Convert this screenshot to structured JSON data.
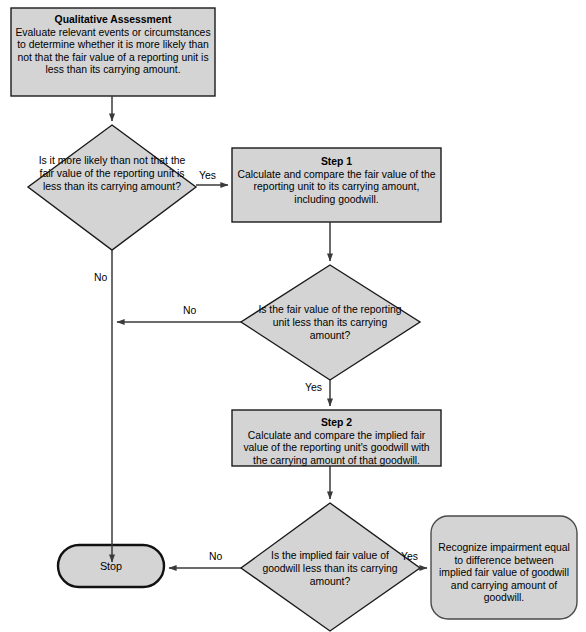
{
  "diagram": {
    "type": "flowchart",
    "background_color": "#ffffff",
    "shape_fill_color": "#d4d4d4",
    "shape_stroke_color": "#1a1a1a",
    "connector_color": "#3a3a3a",
    "text_color": "#000000"
  },
  "nodes": {
    "qualitative_assessment": {
      "shape": "process",
      "heading": "Qualitative Assessment",
      "body": "Evaluate relevant events or circumstances to determine whether it is more likely than not that the fair value of a reporting unit is less than its carrying amount."
    },
    "decision_1": {
      "shape": "decision",
      "text": "Is it more likely than not that the fair value of the reporting unit is less than its carrying amount?"
    },
    "step_1": {
      "shape": "process",
      "heading": "Step 1",
      "body": "Calculate and compare the fair value of the reporting unit to its carrying amount, including goodwill."
    },
    "decision_2": {
      "shape": "decision",
      "text": "Is the fair value of the reporting unit less than its carrying amount?"
    },
    "step_2": {
      "shape": "process",
      "heading": "Step 2",
      "body": "Calculate and compare the implied fair value of the reporting unit's goodwill with the carrying amount of that goodwill."
    },
    "decision_3": {
      "shape": "decision",
      "text": "Is the implied fair value of goodwill less than its carrying amount?"
    },
    "recognize_impairment": {
      "shape": "rounded-process",
      "text": "Recognize impairment equal to difference between implied fair value of goodwill and carrying amount of goodwill."
    },
    "stop": {
      "shape": "terminator",
      "text": "Stop"
    }
  },
  "edge_labels": {
    "d1_yes": "Yes",
    "d1_no": "No",
    "d2_no": "No",
    "d2_yes": "Yes",
    "d3_no": "No",
    "d3_yes": "Yes"
  }
}
